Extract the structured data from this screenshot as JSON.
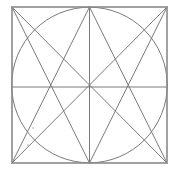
{
  "diagram": {
    "title": "",
    "colors": {
      "background": "#ffffff",
      "line": "#7a7a7a",
      "frame": "#8a8a8a"
    },
    "square": {
      "x1": 12,
      "y1": 7,
      "x2": 167,
      "y2": 163
    },
    "circle": {
      "cx": 89.5,
      "cy": 85,
      "r": 77.8
    },
    "center_lines": [
      {
        "name": "horizontal-midline",
        "x1": 12,
        "y1": 87,
        "x2": 167,
        "y2": 87
      },
      {
        "name": "vertical-midline",
        "x1": 89.5,
        "y1": 7,
        "x2": 89.5,
        "y2": 163
      }
    ],
    "diagonals": [
      {
        "name": "diagonal-tl-br",
        "x1": 12,
        "y1": 7,
        "x2": 167,
        "y2": 163
      },
      {
        "name": "diagonal-tr-bl",
        "x1": 167,
        "y1": 7,
        "x2": 12,
        "y2": 163
      }
    ],
    "corner_to_midpoint_lines": [
      {
        "name": "line-tl-to-bottom-mid",
        "x1": 12,
        "y1": 7,
        "x2": 89.5,
        "y2": 163
      },
      {
        "name": "line-tr-to-bottom-mid",
        "x1": 167,
        "y1": 7,
        "x2": 89.5,
        "y2": 163
      },
      {
        "name": "line-bl-to-top-mid",
        "x1": 12,
        "y1": 163,
        "x2": 89.5,
        "y2": 7
      },
      {
        "name": "line-br-to-top-mid",
        "x1": 167,
        "y1": 163,
        "x2": 89.5,
        "y2": 7
      }
    ],
    "stray_marks": [
      {
        "name": "mark-1",
        "x": 33,
        "y": 128
      },
      {
        "name": "mark-2",
        "x": 28,
        "y": 145
      }
    ]
  }
}
